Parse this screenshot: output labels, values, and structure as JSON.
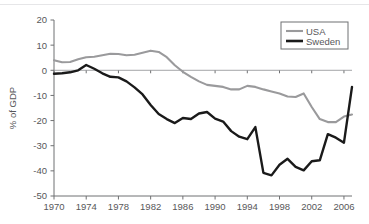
{
  "chart_data": {
    "type": "line",
    "title": "",
    "subtitle": "",
    "xlabel": "",
    "ylabel": "% of GDP",
    "xlim": [
      1970,
      2007
    ],
    "ylim": [
      -50,
      20
    ],
    "grid": false,
    "legend_position": "top-right",
    "x_ticks": [
      1970,
      1974,
      1978,
      1982,
      1986,
      1990,
      1994,
      1998,
      2002,
      2006
    ],
    "x_tick_labels": [
      "1970",
      "1974",
      "1978",
      "1982",
      "1986",
      "1990",
      "1994",
      "1998",
      "2002",
      "2006"
    ],
    "y_ticks": [
      20,
      10,
      0,
      -10,
      -20,
      -30,
      -40,
      -50
    ],
    "y_tick_labels": [
      "20",
      "10",
      "0",
      "-10",
      "-20",
      "-30",
      "-40",
      "-50"
    ],
    "x": [
      1970,
      1971,
      1972,
      1973,
      1974,
      1975,
      1976,
      1977,
      1978,
      1979,
      1980,
      1981,
      1982,
      1983,
      1984,
      1985,
      1986,
      1987,
      1988,
      1989,
      1990,
      1991,
      1992,
      1993,
      1994,
      1995,
      1996,
      1997,
      1998,
      1999,
      2000,
      2001,
      2002,
      2003,
      2004,
      2005,
      2006,
      2007
    ],
    "series": [
      {
        "name": "USA",
        "color": "#9a9a9c",
        "width": 2.1,
        "values": [
          4.0,
          3.2,
          3.3,
          4.4,
          5.2,
          5.4,
          6.0,
          6.6,
          6.5,
          6.0,
          6.2,
          7.0,
          7.8,
          7.3,
          5.2,
          2.0,
          -0.6,
          -2.6,
          -4.4,
          -5.8,
          -6.2,
          -6.6,
          -7.6,
          -7.6,
          -6.2,
          -6.6,
          -7.6,
          -8.4,
          -9.2,
          -10.4,
          -10.6,
          -9.2,
          -14.6,
          -19.4,
          -20.6,
          -20.6,
          -18.4,
          -17.6
        ]
      },
      {
        "name": "Sweden",
        "color": "#1a1a1a",
        "width": 2.4,
        "values": [
          -1.4,
          -1.2,
          -0.8,
          0.0,
          2.1,
          0.6,
          -1.2,
          -2.6,
          -2.8,
          -4.4,
          -6.8,
          -9.6,
          -13.8,
          -17.4,
          -19.4,
          -21.0,
          -19.0,
          -19.4,
          -17.2,
          -16.6,
          -19.2,
          -20.4,
          -24.2,
          -26.4,
          -27.4,
          -22.6,
          -40.8,
          -41.8,
          -37.6,
          -35.2,
          -38.4,
          -39.8,
          -36.2,
          -35.8,
          -25.4,
          -26.8,
          -28.8,
          -6.6
        ]
      }
    ]
  },
  "legend": {
    "entries": [
      {
        "label": "USA"
      },
      {
        "label": "Sweden"
      }
    ]
  }
}
